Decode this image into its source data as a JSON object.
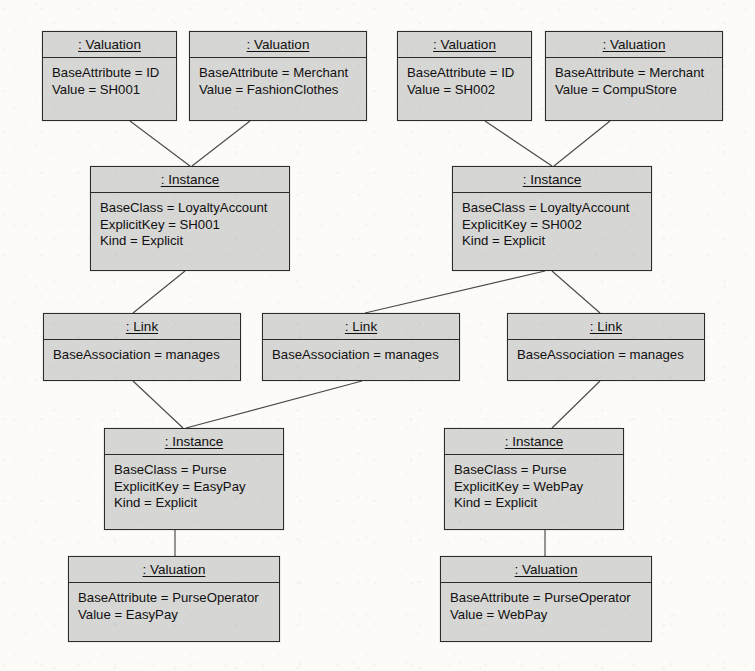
{
  "diagram": {
    "type": "uml-object-diagram",
    "box_fill": "#d6d6d4",
    "box_border": "#2b2b2b",
    "connector_color": "#4a4a4a",
    "background": "#fcfbf8"
  },
  "nodes": [
    {
      "id": "val-id-sh001",
      "header": ": Valuation",
      "attributes": [
        "BaseAttribute = ID",
        "Value = SH001"
      ],
      "x": 42,
      "y": 31,
      "w": 135,
      "h": 90
    },
    {
      "id": "val-merchant-fashionclothes",
      "header": ": Valuation",
      "attributes": [
        "BaseAttribute = Merchant",
        "Value = FashionClothes"
      ],
      "x": 189,
      "y": 31,
      "w": 178,
      "h": 90
    },
    {
      "id": "val-id-sh002",
      "header": ": Valuation",
      "attributes": [
        "BaseAttribute = ID",
        "Value = SH002"
      ],
      "x": 397,
      "y": 31,
      "w": 135,
      "h": 90
    },
    {
      "id": "val-merchant-compustore",
      "header": ": Valuation",
      "attributes": [
        "BaseAttribute = Merchant",
        "Value = CompuStore"
      ],
      "x": 545,
      "y": 31,
      "w": 178,
      "h": 90
    },
    {
      "id": "inst-loyaltyaccount-sh001",
      "header": ": Instance",
      "attributes": [
        "BaseClass = LoyaltyAccount",
        "ExplicitKey = SH001",
        "Kind = Explicit"
      ],
      "x": 90,
      "y": 166,
      "w": 200,
      "h": 105
    },
    {
      "id": "inst-loyaltyaccount-sh002",
      "header": ": Instance",
      "attributes": [
        "BaseClass = LoyaltyAccount",
        "ExplicitKey = SH002",
        "Kind = Explicit"
      ],
      "x": 452,
      "y": 166,
      "w": 200,
      "h": 105
    },
    {
      "id": "link-manages-1",
      "header": ": Link",
      "attributes": [
        "BaseAssociation = manages"
      ],
      "x": 43,
      "y": 313,
      "w": 198,
      "h": 68
    },
    {
      "id": "link-manages-2",
      "header": ": Link",
      "attributes": [
        "BaseAssociation = manages"
      ],
      "x": 262,
      "y": 313,
      "w": 198,
      "h": 68
    },
    {
      "id": "link-manages-3",
      "header": ": Link",
      "attributes": [
        "BaseAssociation = manages"
      ],
      "x": 507,
      "y": 313,
      "w": 198,
      "h": 68
    },
    {
      "id": "inst-purse-easypay",
      "header": ": Instance",
      "attributes": [
        "BaseClass = Purse",
        "ExplicitKey = EasyPay",
        "Kind = Explicit"
      ],
      "x": 104,
      "y": 428,
      "w": 180,
      "h": 102
    },
    {
      "id": "inst-purse-webpay",
      "header": ": Instance",
      "attributes": [
        "BaseClass = Purse",
        "ExplicitKey = WebPay",
        "Kind = Explicit"
      ],
      "x": 444,
      "y": 428,
      "w": 180,
      "h": 102
    },
    {
      "id": "val-purseoperator-easypay",
      "header": ": Valuation",
      "attributes": [
        "BaseAttribute = PurseOperator",
        "Value = EasyPay"
      ],
      "x": 68,
      "y": 556,
      "w": 212,
      "h": 86
    },
    {
      "id": "val-purseoperator-webpay",
      "header": ": Valuation",
      "attributes": [
        "BaseAttribute = PurseOperator",
        "Value = WebPay"
      ],
      "x": 440,
      "y": 556,
      "w": 212,
      "h": 86
    }
  ],
  "connectors": [
    {
      "from": "val-id-sh001",
      "to": "inst-loyaltyaccount-sh001",
      "x1": 130,
      "y1": 121,
      "x2": 190,
      "y2": 166
    },
    {
      "from": "val-merchant-fashionclothes",
      "to": "inst-loyaltyaccount-sh001",
      "x1": 250,
      "y1": 121,
      "x2": 192,
      "y2": 166
    },
    {
      "from": "val-id-sh002",
      "to": "inst-loyaltyaccount-sh002",
      "x1": 485,
      "y1": 121,
      "x2": 552,
      "y2": 166
    },
    {
      "from": "val-merchant-compustore",
      "to": "inst-loyaltyaccount-sh002",
      "x1": 610,
      "y1": 121,
      "x2": 554,
      "y2": 166
    },
    {
      "from": "inst-loyaltyaccount-sh001",
      "to": "link-manages-1",
      "x1": 185,
      "y1": 271,
      "x2": 133,
      "y2": 313
    },
    {
      "from": "inst-loyaltyaccount-sh002",
      "to": "link-manages-2",
      "x1": 545,
      "y1": 271,
      "x2": 365,
      "y2": 313
    },
    {
      "from": "inst-loyaltyaccount-sh002",
      "to": "link-manages-3",
      "x1": 552,
      "y1": 271,
      "x2": 600,
      "y2": 313
    },
    {
      "from": "link-manages-1",
      "to": "inst-purse-easypay",
      "x1": 133,
      "y1": 381,
      "x2": 183,
      "y2": 428
    },
    {
      "from": "link-manages-2",
      "to": "inst-purse-easypay",
      "x1": 362,
      "y1": 381,
      "x2": 186,
      "y2": 428
    },
    {
      "from": "link-manages-3",
      "to": "inst-purse-webpay",
      "x1": 600,
      "y1": 381,
      "x2": 552,
      "y2": 428
    },
    {
      "from": "inst-purse-easypay",
      "to": "val-purseoperator-easypay",
      "x1": 175,
      "y1": 530,
      "x2": 175,
      "y2": 556
    },
    {
      "from": "inst-purse-webpay",
      "to": "val-purseoperator-webpay",
      "x1": 545,
      "y1": 530,
      "x2": 545,
      "y2": 556
    }
  ]
}
